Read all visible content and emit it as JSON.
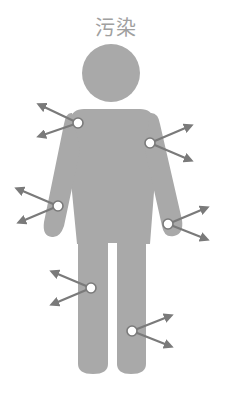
{
  "title": "污染",
  "colors": {
    "body": "#a9a9a9",
    "arrow": "#7a7a7a",
    "node_fill": "#ffffff",
    "node_stroke": "#7a7a7a",
    "title": "#a0a0a0"
  },
  "figure": {
    "type": "human-silhouette",
    "head": {
      "cx": 111,
      "cy": 73,
      "r": 29
    }
  },
  "contamination_points": [
    {
      "id": "left-shoulder",
      "x": 78,
      "y": 123,
      "arrows": [
        {
          "dx": -38,
          "dy": -18
        },
        {
          "dx": -38,
          "dy": 13
        }
      ]
    },
    {
      "id": "right-shoulder",
      "x": 150,
      "y": 143,
      "arrows": [
        {
          "dx": 40,
          "dy": -17
        },
        {
          "dx": 40,
          "dy": 17
        }
      ]
    },
    {
      "id": "left-forearm",
      "x": 58,
      "y": 206,
      "arrows": [
        {
          "dx": -40,
          "dy": -17
        },
        {
          "dx": -38,
          "dy": 16
        }
      ]
    },
    {
      "id": "right-hand",
      "x": 168,
      "y": 224,
      "arrows": [
        {
          "dx": 38,
          "dy": -16
        },
        {
          "dx": 38,
          "dy": 15
        }
      ]
    },
    {
      "id": "left-thigh",
      "x": 91,
      "y": 288,
      "arrows": [
        {
          "dx": -38,
          "dy": -16
        },
        {
          "dx": -38,
          "dy": 16
        }
      ]
    },
    {
      "id": "right-shin",
      "x": 132,
      "y": 331,
      "arrows": [
        {
          "dx": 38,
          "dy": -15
        },
        {
          "dx": 38,
          "dy": 15
        }
      ]
    }
  ],
  "footer_partial_text": "…………"
}
